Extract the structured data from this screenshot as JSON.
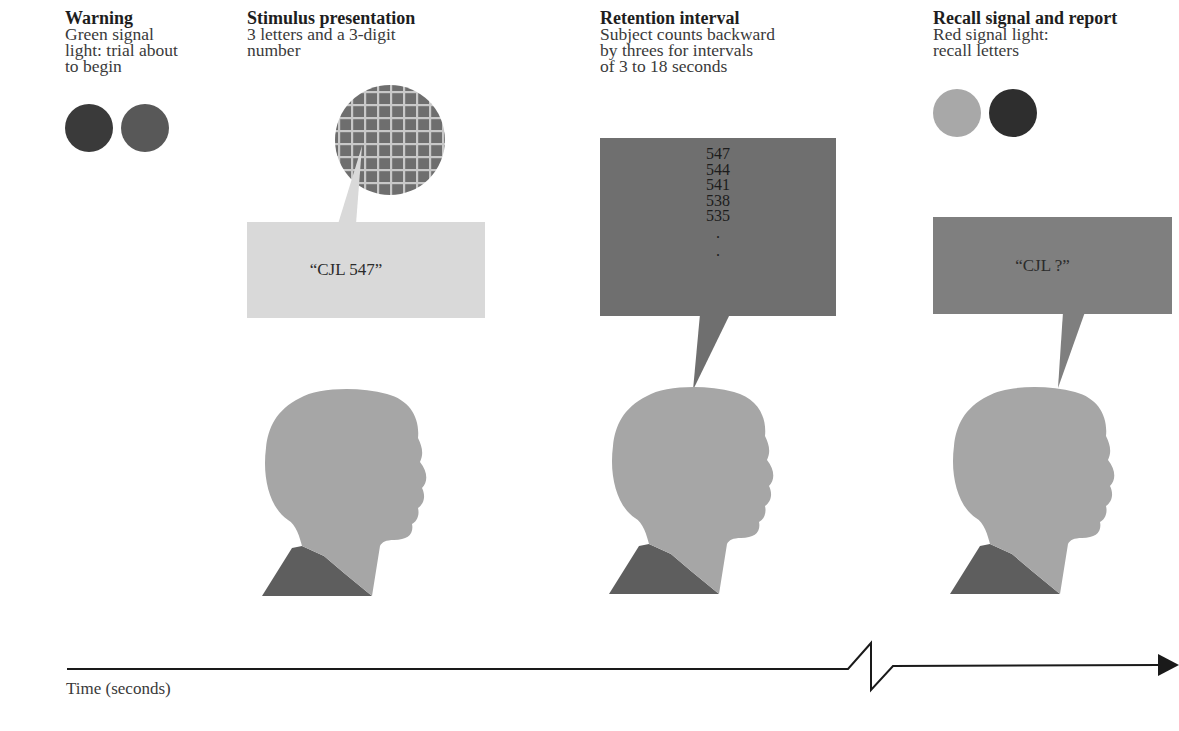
{
  "diagram": {
    "type": "procedure-timeline",
    "stages": [
      {
        "id": "warning",
        "title": "Warning",
        "description": "Green signal\nlight: trial about\nto begin",
        "signal_lights": [
          {
            "name": "light-1",
            "color": "#3a3a3a"
          },
          {
            "name": "light-2",
            "color": "#585858"
          }
        ]
      },
      {
        "id": "stimulus",
        "title": "Stimulus presentation",
        "description": "3 letters and a 3-digit\nnumber",
        "speech": "“CJL 547”",
        "bubble_color": "#d9d9d9",
        "display_color": "#6e6e6e"
      },
      {
        "id": "retention",
        "title": "Retention interval",
        "description": "Subject counts backward\nby threes for intervals\nof 3 to 18 seconds",
        "counting": [
          "547",
          "544",
          "541",
          "538",
          "535",
          ".",
          "."
        ],
        "bubble_color": "#6f6f6f"
      },
      {
        "id": "recall",
        "title": "Recall signal and report",
        "description": "Red signal light:\nrecall letters",
        "speech": "“CJL ?”",
        "bubble_color": "#7f7f7f",
        "signal_lights": [
          {
            "name": "light-1",
            "color": "#a8a8a8"
          },
          {
            "name": "light-2",
            "color": "#2e2e2e"
          }
        ]
      }
    ],
    "axis": {
      "label": "Time (seconds)",
      "has_break": true,
      "arrow": "right"
    },
    "colors": {
      "head": "#a6a6a6",
      "shoulder": "#5e5e5e",
      "line": "#1a1a1a"
    }
  }
}
